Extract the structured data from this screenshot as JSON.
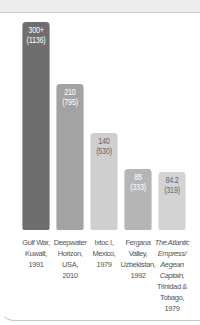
{
  "chart_data": {
    "type": "bar",
    "title": "",
    "xlabel": "",
    "ylabel": "",
    "ylim": [
      0,
      320
    ],
    "grid": false,
    "categories": [
      "Gulf War, Kuwait, 1991",
      "Deepwater Horizon, USA, 2010",
      "Ixtoc I, Mexico, 1979",
      "Fergana Valley, Uzbekistan, 1992",
      "The Atlantic Empress/ Aegean Captain, Trinidad & Tobago, 1979"
    ],
    "values": [
      300,
      210,
      140,
      88,
      84.2
    ],
    "secondary_values": [
      1136,
      795,
      530,
      333,
      319
    ],
    "value_labels": [
      "300+",
      "210",
      "140",
      "88",
      "84.2"
    ],
    "secondary_labels": [
      "(1136)",
      "(795)",
      "(530)",
      "(333)",
      "(319)"
    ],
    "colors": [
      "#6e6e6e",
      "#a3a3a3",
      "#cfcfcf",
      "#b5b5b5",
      "#d3d3d3"
    ]
  },
  "bars": [
    {
      "value": "300+",
      "sub": "(1136)",
      "color": "#6e6e6e",
      "text_color": "#ffffff"
    },
    {
      "value": "210",
      "sub": "(795)",
      "color": "#a3a3a3",
      "text_color": "#ffffff"
    },
    {
      "value": "140",
      "sub": "(530)",
      "color": "#cfcfcf",
      "text_color": "#666666"
    },
    {
      "value": "88",
      "sub": "(333)",
      "color": "#b5b5b5",
      "text_color": "#ffffff"
    },
    {
      "value": "84.2",
      "sub": "(319)",
      "color": "#d3d3d3",
      "text_color": "#666666"
    }
  ],
  "labels": [
    {
      "lines": [
        "Gulf War,",
        "Kuwait,",
        "1991"
      ]
    },
    {
      "lines": [
        "Deepwater",
        "Horizon,",
        "USA,",
        "2010"
      ]
    },
    {
      "lines": [
        "Ixtoc I,",
        "Mexico,",
        "1979"
      ]
    },
    {
      "lines": [
        "Fergana",
        "Valley,",
        "Uzbekistan,",
        "1992"
      ]
    },
    {
      "lines": [
        "The Atlantic",
        "Empress/",
        "Aegean",
        "Captain,",
        "Trinidad &",
        "Tobago, 1979"
      ],
      "italic_lines": 4
    }
  ]
}
